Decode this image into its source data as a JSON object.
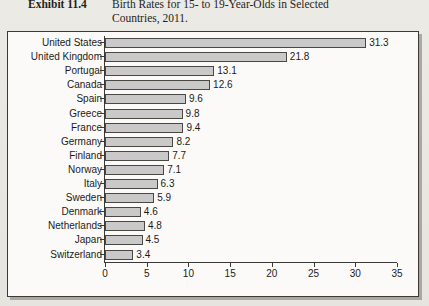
{
  "caption": {
    "exhibit_label": "Exhibit 11.4",
    "line1": "Birth Rates for 15- to 19-Year-Olds in Selected",
    "line2": "Countries, 2011."
  },
  "colors": {
    "bar_fill": "#c9c9c9",
    "bar_border": "#4a4845",
    "axis": "#3b3936",
    "chart_background": "#fbfaf8",
    "page_background": "#e9e7e2",
    "text": "#1c1a18"
  },
  "chart_data": {
    "type": "bar",
    "orientation": "horizontal",
    "title": "Birth Rates for 15- to 19-Year-Olds in Selected Countries, 2011.",
    "xlabel": "",
    "ylabel": "",
    "xlim": [
      0,
      35
    ],
    "xticks": [
      0,
      5,
      10,
      15,
      20,
      25,
      30,
      35
    ],
    "grid": false,
    "legend": false,
    "data_labels": true,
    "categories": [
      "United States",
      "United Kingdom",
      "Portugal",
      "Canada",
      "Spain",
      "Greece",
      "France",
      "Germany",
      "Finland",
      "Norway",
      "Italy",
      "Sweden",
      "Denmark",
      "Netherlands",
      "Japan",
      "Switzerland"
    ],
    "values": [
      31.3,
      21.8,
      13.1,
      12.6,
      9.6,
      9.8,
      9.4,
      8.2,
      7.7,
      7.1,
      6.3,
      5.9,
      4.6,
      4.8,
      4.5,
      3.4
    ],
    "value_labels": [
      "31.3",
      "21.8",
      "13.1",
      "12.6",
      "9.6",
      "9.8",
      "9.4",
      "8.2",
      "7.7",
      "7.1",
      "6.3",
      "5.9",
      "4.6",
      "4.8",
      "4.5",
      "3.4"
    ],
    "bar_lengths_drawn": [
      31.3,
      21.8,
      13.1,
      12.6,
      9.7,
      9.3,
      9.4,
      8.2,
      7.7,
      7.1,
      6.3,
      5.9,
      4.3,
      4.8,
      4.5,
      3.4
    ]
  }
}
